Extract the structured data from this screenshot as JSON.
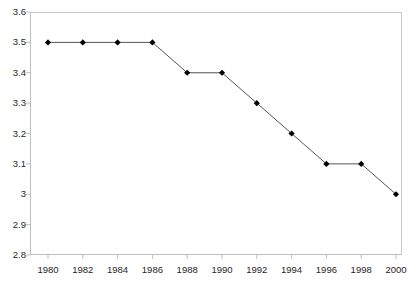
{
  "chart_data": {
    "type": "line",
    "title": "",
    "subtitle": "",
    "xlabel": "",
    "ylabel": "",
    "x": [
      1980,
      1982,
      1984,
      1986,
      1988,
      1990,
      1992,
      1994,
      1996,
      1998,
      2000
    ],
    "values": [
      3.5,
      3.5,
      3.5,
      3.5,
      3.4,
      3.4,
      3.3,
      3.2,
      3.1,
      3.1,
      3.0
    ],
    "series": [
      {
        "name": "",
        "values": [
          3.5,
          3.5,
          3.5,
          3.5,
          3.4,
          3.4,
          3.3,
          3.2,
          3.1,
          3.1,
          3.0
        ]
      }
    ],
    "x_tick_labels": [
      "1980",
      "1982",
      "1984",
      "1986",
      "1988",
      "1990",
      "1992",
      "1994",
      "1996",
      "1998",
      "2000"
    ],
    "y_tick_labels": [
      "3.6",
      "3.5",
      "3.4",
      "3.3",
      "3.2",
      "3.1",
      "3",
      "2.9",
      "2.8"
    ],
    "y_tick_values": [
      3.6,
      3.5,
      3.4,
      3.3,
      3.2,
      3.1,
      3.0,
      2.9,
      2.8
    ],
    "ylim": [
      2.8,
      3.6
    ],
    "xlim": [
      1980,
      2000
    ],
    "y_tick_step": 0.1,
    "x_tick_step": 2,
    "grid": false,
    "legend": false,
    "legend_position": "none",
    "marker": "diamond",
    "marker_color": "#000000",
    "line_color": "#555555",
    "axis_color": "#bfbfbf",
    "text_color": "#262626",
    "background": "#ffffff"
  }
}
